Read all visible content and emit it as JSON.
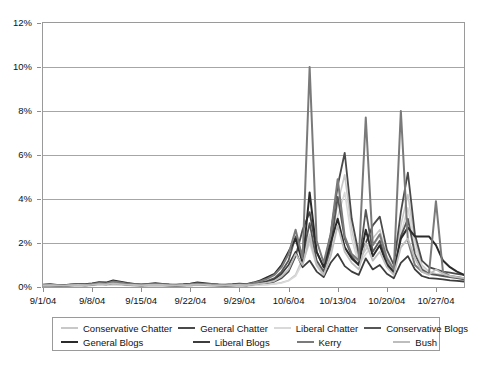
{
  "chart_data": {
    "type": "line",
    "title": "",
    "xlabel": "",
    "ylabel": "",
    "ylim": [
      0,
      12
    ],
    "y_unit": "%",
    "grid": true,
    "legend_position": "bottom",
    "y_ticks": [
      {
        "value": 12,
        "label": "12%"
      },
      {
        "value": 10,
        "label": "10%"
      },
      {
        "value": 8,
        "label": "8%"
      },
      {
        "value": 6,
        "label": "6%"
      },
      {
        "value": 4,
        "label": "4%"
      },
      {
        "value": 2,
        "label": "2%"
      },
      {
        "value": 0,
        "label": "0%"
      }
    ],
    "x_ticks": [
      {
        "index": 0,
        "label": "9/1/04"
      },
      {
        "index": 7,
        "label": "9/8/04"
      },
      {
        "index": 14,
        "label": "9/15/04"
      },
      {
        "index": 21,
        "label": "9/22/04"
      },
      {
        "index": 28,
        "label": "9/29/04"
      },
      {
        "index": 35,
        "label": "10/6/04"
      },
      {
        "index": 42,
        "label": "10/13/04"
      },
      {
        "index": 49,
        "label": "10/20/04"
      },
      {
        "index": 56,
        "label": "10/27/04"
      }
    ],
    "x_count": 61,
    "x_start_label": "9/1/04",
    "x_end_label": "10/31/04",
    "series": [
      {
        "name": "Conservative Chatter",
        "color": "#c8c8c8",
        "width": 1.6,
        "values": [
          0.05,
          0.06,
          0.05,
          0.04,
          0.06,
          0.07,
          0.06,
          0.08,
          0.1,
          0.09,
          0.12,
          0.1,
          0.08,
          0.07,
          0.06,
          0.07,
          0.08,
          0.07,
          0.06,
          0.05,
          0.06,
          0.07,
          0.09,
          0.08,
          0.07,
          0.06,
          0.05,
          0.06,
          0.07,
          0.06,
          0.08,
          0.1,
          0.12,
          0.15,
          0.2,
          0.3,
          0.55,
          1.3,
          2.4,
          1.1,
          0.6,
          1.9,
          3.8,
          5.1,
          2.6,
          1.2,
          1.7,
          2.2,
          2.6,
          1.4,
          0.8,
          2.8,
          4.2,
          2.1,
          1.0,
          0.7,
          0.6,
          0.55,
          0.5,
          0.45,
          0.4
        ]
      },
      {
        "name": "General Chatter",
        "color": "#4a4a4a",
        "width": 1.8,
        "values": [
          0.06,
          0.07,
          0.06,
          0.05,
          0.07,
          0.08,
          0.07,
          0.09,
          0.12,
          0.11,
          0.14,
          0.12,
          0.1,
          0.08,
          0.07,
          0.08,
          0.09,
          0.08,
          0.07,
          0.06,
          0.07,
          0.08,
          0.1,
          0.09,
          0.08,
          0.07,
          0.06,
          0.07,
          0.08,
          0.07,
          0.1,
          0.14,
          0.18,
          0.25,
          0.4,
          0.7,
          1.4,
          2.6,
          3.4,
          1.6,
          0.9,
          2.4,
          4.6,
          6.1,
          3.1,
          1.5,
          2.0,
          2.8,
          3.2,
          1.7,
          1.0,
          3.4,
          5.2,
          2.4,
          1.2,
          0.9,
          0.8,
          0.7,
          0.65,
          0.6,
          0.55
        ]
      },
      {
        "name": "Liberal Chatter",
        "color": "#d9d9d9",
        "width": 1.6,
        "values": [
          0.04,
          0.05,
          0.04,
          0.04,
          0.05,
          0.06,
          0.05,
          0.07,
          0.09,
          0.08,
          0.1,
          0.09,
          0.07,
          0.06,
          0.05,
          0.06,
          0.07,
          0.06,
          0.05,
          0.05,
          0.06,
          0.06,
          0.08,
          0.07,
          0.06,
          0.05,
          0.05,
          0.06,
          0.06,
          0.06,
          0.07,
          0.09,
          0.11,
          0.14,
          0.18,
          0.28,
          0.5,
          1.1,
          2.0,
          0.95,
          0.5,
          1.6,
          3.2,
          4.3,
          2.2,
          1.0,
          1.5,
          1.9,
          2.3,
          1.2,
          0.7,
          2.4,
          3.6,
          1.8,
          0.9,
          0.6,
          0.55,
          0.5,
          0.45,
          0.42,
          0.38
        ]
      },
      {
        "name": "Conservative Blogs",
        "color": "#565656",
        "width": 1.8,
        "values": [
          0.08,
          0.09,
          0.07,
          0.06,
          0.09,
          0.11,
          0.09,
          0.12,
          0.16,
          0.14,
          0.2,
          0.16,
          0.12,
          0.1,
          0.08,
          0.1,
          0.12,
          0.1,
          0.08,
          0.07,
          0.09,
          0.11,
          0.14,
          0.12,
          0.1,
          0.08,
          0.07,
          0.09,
          0.11,
          0.09,
          0.14,
          0.2,
          0.28,
          0.4,
          0.7,
          1.2,
          2.3,
          1.4,
          2.9,
          1.2,
          0.7,
          1.8,
          4.1,
          2.2,
          1.4,
          1.0,
          3.5,
          1.6,
          2.1,
          1.1,
          0.6,
          2.3,
          3.1,
          1.5,
          0.8,
          0.6,
          0.55,
          0.5,
          0.45,
          0.4,
          0.35
        ]
      },
      {
        "name": "General Blogs",
        "color": "#2b2b2b",
        "width": 2.0,
        "values": [
          0.1,
          0.12,
          0.09,
          0.08,
          0.11,
          0.14,
          0.12,
          0.16,
          0.22,
          0.2,
          0.3,
          0.24,
          0.18,
          0.14,
          0.11,
          0.14,
          0.17,
          0.14,
          0.11,
          0.1,
          0.12,
          0.15,
          0.2,
          0.17,
          0.14,
          0.11,
          0.1,
          0.12,
          0.15,
          0.13,
          0.2,
          0.3,
          0.45,
          0.6,
          1.0,
          1.6,
          2.2,
          1.1,
          4.3,
          1.6,
          0.9,
          2.0,
          3.1,
          1.8,
          1.3,
          1.0,
          2.6,
          1.4,
          1.9,
          1.0,
          0.7,
          2.2,
          2.7,
          2.3,
          2.3,
          2.3,
          1.9,
          1.2,
          0.9,
          0.7,
          0.55
        ]
      },
      {
        "name": "Liberal Blogs",
        "color": "#3d3d3d",
        "width": 1.8,
        "values": [
          0.07,
          0.08,
          0.06,
          0.05,
          0.08,
          0.1,
          0.08,
          0.1,
          0.14,
          0.12,
          0.18,
          0.14,
          0.1,
          0.09,
          0.07,
          0.09,
          0.11,
          0.09,
          0.07,
          0.06,
          0.08,
          0.1,
          0.12,
          0.1,
          0.09,
          0.07,
          0.06,
          0.08,
          0.1,
          0.08,
          0.12,
          0.18,
          0.24,
          0.35,
          0.6,
          1.0,
          1.6,
          0.9,
          1.2,
          0.7,
          0.45,
          1.1,
          1.5,
          0.95,
          0.7,
          0.55,
          1.3,
          0.8,
          1.0,
          0.6,
          0.4,
          1.1,
          1.4,
          0.8,
          0.5,
          0.4,
          0.38,
          0.35,
          0.3,
          0.28,
          0.25
        ]
      },
      {
        "name": "Kerry",
        "color": "#7a7a7a",
        "width": 2.0,
        "values": [
          0.09,
          0.1,
          0.08,
          0.07,
          0.1,
          0.12,
          0.1,
          0.14,
          0.18,
          0.16,
          0.25,
          0.2,
          0.15,
          0.12,
          0.1,
          0.12,
          0.14,
          0.12,
          0.1,
          0.08,
          0.1,
          0.13,
          0.16,
          0.14,
          0.12,
          0.1,
          0.08,
          0.1,
          0.13,
          0.11,
          0.18,
          0.26,
          0.38,
          0.55,
          0.9,
          1.5,
          2.6,
          1.3,
          10.0,
          2.1,
          1.1,
          2.4,
          4.9,
          2.3,
          1.5,
          1.2,
          7.7,
          1.9,
          2.4,
          1.3,
          0.8,
          8.0,
          2.1,
          1.0,
          0.7,
          0.6,
          3.9,
          0.7,
          0.5,
          0.45,
          0.4
        ]
      },
      {
        "name": "Bush",
        "color": "#bdbdbd",
        "width": 1.8,
        "values": [
          0.07,
          0.08,
          0.07,
          0.06,
          0.08,
          0.09,
          0.08,
          0.1,
          0.13,
          0.12,
          0.16,
          0.13,
          0.1,
          0.09,
          0.07,
          0.09,
          0.1,
          0.09,
          0.07,
          0.07,
          0.08,
          0.09,
          0.11,
          0.1,
          0.08,
          0.07,
          0.07,
          0.08,
          0.09,
          0.08,
          0.11,
          0.15,
          0.2,
          0.28,
          0.48,
          0.8,
          1.5,
          1.0,
          2.2,
          1.0,
          0.55,
          1.4,
          2.8,
          1.6,
          1.1,
          0.8,
          2.0,
          1.2,
          1.6,
          0.9,
          0.55,
          1.8,
          2.2,
          1.3,
          0.7,
          0.55,
          0.8,
          0.6,
          0.5,
          0.45,
          0.4
        ]
      }
    ]
  },
  "legend": {
    "rows": [
      [
        {
          "label": "Conservative Chatter",
          "color": "#c8c8c8",
          "width": 150
        },
        {
          "label": "General Chatter",
          "color": "#4a4a4a",
          "width": 118
        },
        {
          "label": "Liberal Chatter",
          "color": "#d9d9d9",
          "width": 110
        },
        {
          "label": "Conservative Blogs",
          "color": "#565656",
          "width": 0
        }
      ],
      [
        {
          "label": "General Blogs",
          "color": "#2b2b2b",
          "width": 150
        },
        {
          "label": "Liberal Blogs",
          "color": "#3d3d3d",
          "width": 118
        },
        {
          "label": "Kerry",
          "color": "#7a7a7a",
          "width": 110
        },
        {
          "label": "Bush",
          "color": "#bdbdbd",
          "width": 0
        }
      ]
    ]
  }
}
